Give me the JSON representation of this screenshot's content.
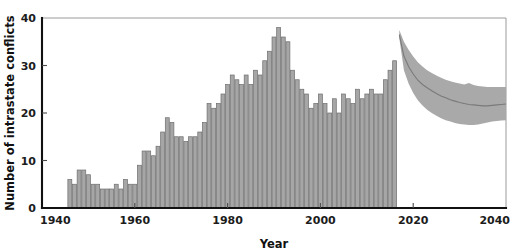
{
  "chart_data": {
    "type": "bar",
    "title": "",
    "xlabel": "Year",
    "ylabel": "Number of intrastate conflicts",
    "xlim": [
      1940,
      2040
    ],
    "ylim": [
      0,
      40
    ],
    "xticks": [
      1940,
      1960,
      1980,
      2000,
      2020,
      2040
    ],
    "xtick_labels": [
      "1940",
      "1960",
      "1980",
      "2000",
      "2020",
      "2040"
    ],
    "yticks": [
      0,
      10,
      20,
      30,
      40
    ],
    "ytick_labels": [
      "0",
      "10",
      "20",
      "30",
      "40"
    ],
    "grid": false,
    "legend": "none",
    "bar_color": "#a6a6a6",
    "bar_edge_color": "#6e6e6e",
    "projection_band_color": "#a9a9a9",
    "projection_median_color": "#7a7a7a",
    "series": [
      {
        "name": "Observed intrastate conflicts",
        "type": "bar",
        "x": [
          1946,
          1947,
          1948,
          1949,
          1950,
          1951,
          1952,
          1953,
          1954,
          1955,
          1956,
          1957,
          1958,
          1959,
          1960,
          1961,
          1962,
          1963,
          1964,
          1965,
          1966,
          1967,
          1968,
          1969,
          1970,
          1971,
          1972,
          1973,
          1974,
          1975,
          1976,
          1977,
          1978,
          1979,
          1980,
          1981,
          1982,
          1983,
          1984,
          1985,
          1986,
          1987,
          1988,
          1989,
          1990,
          1991,
          1992,
          1993,
          1994,
          1995,
          1996,
          1997,
          1998,
          1999,
          2000,
          2001,
          2002,
          2003,
          2004,
          2005,
          2006,
          2007,
          2008,
          2009,
          2010,
          2011,
          2012,
          2013,
          2014,
          2015,
          2016
        ],
        "values": [
          6,
          5,
          8,
          8,
          7,
          5,
          5,
          4,
          4,
          4,
          5,
          4,
          6,
          5,
          5,
          9,
          12,
          12,
          11,
          13,
          16,
          19,
          18,
          15,
          15,
          14,
          15,
          15,
          16,
          18,
          22,
          21,
          22,
          24,
          26,
          28,
          27,
          26,
          28,
          26,
          29,
          28,
          31,
          33,
          36,
          38,
          36,
          35,
          29,
          27,
          25,
          24,
          21,
          22,
          24,
          22,
          20,
          23,
          20,
          24,
          23,
          22,
          25,
          23,
          24,
          25,
          24,
          24,
          27,
          29,
          31
        ]
      },
      {
        "name": "Projected intrastate conflicts (median)",
        "type": "line",
        "x": [
          2017,
          2018,
          2019,
          2020,
          2021,
          2022,
          2023,
          2024,
          2025,
          2026,
          2027,
          2028,
          2029,
          2030,
          2031,
          2032,
          2033,
          2034,
          2035,
          2036,
          2037,
          2038,
          2039,
          2040
        ],
        "values": [
          36.5,
          32.0,
          29.8,
          28.2,
          26.9,
          26.0,
          25.3,
          24.7,
          24.1,
          23.6,
          23.2,
          22.8,
          22.5,
          22.2,
          22.0,
          21.8,
          21.7,
          21.6,
          21.5,
          21.5,
          21.6,
          21.7,
          21.8,
          21.9
        ]
      },
      {
        "name": "Projection uncertainty band (upper)",
        "type": "line",
        "x": [
          2017,
          2018,
          2019,
          2020,
          2021,
          2022,
          2023,
          2024,
          2025,
          2026,
          2027,
          2028,
          2029,
          2030,
          2031,
          2032,
          2033,
          2034,
          2035,
          2036,
          2037,
          2038,
          2039,
          2040
        ],
        "values": [
          37.5,
          35.0,
          33.3,
          31.9,
          30.7,
          29.8,
          29.0,
          28.4,
          27.9,
          27.4,
          27.0,
          26.7,
          26.4,
          26.2,
          26.0,
          26.3,
          25.9,
          25.7,
          25.6,
          25.5,
          25.5,
          25.5,
          25.5,
          25.5
        ]
      },
      {
        "name": "Projection uncertainty band (lower)",
        "type": "line",
        "x": [
          2017,
          2018,
          2019,
          2020,
          2021,
          2022,
          2023,
          2024,
          2025,
          2026,
          2027,
          2028,
          2029,
          2030,
          2031,
          2032,
          2033,
          2034,
          2035,
          2036,
          2037,
          2038,
          2039,
          2040
        ],
        "values": [
          35.8,
          29.0,
          26.2,
          24.2,
          22.7,
          21.6,
          20.7,
          20.0,
          19.4,
          18.9,
          18.5,
          18.2,
          17.9,
          17.7,
          17.6,
          17.5,
          17.5,
          17.6,
          17.8,
          18.0,
          18.2,
          18.3,
          18.4,
          18.5
        ]
      }
    ]
  }
}
